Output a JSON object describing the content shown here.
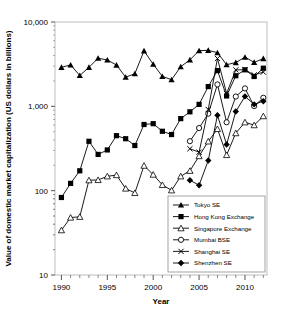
{
  "chart_data": {
    "type": "line",
    "title": "",
    "xlabel": "Year",
    "ylabel": "Value of domestic market capitalization (US dollars in billions)",
    "yscale": "log",
    "ylim": [
      10,
      10000
    ],
    "xlim": [
      1989.3,
      2012.4
    ],
    "ytick_labels": [
      "10",
      "100",
      "1,000",
      "10,000"
    ],
    "ytick_values": [
      10,
      100,
      1000,
      10000
    ],
    "xtick_labels": [
      "1990",
      "1995",
      "2000",
      "2005",
      "2010"
    ],
    "xtick_values": [
      1990,
      1995,
      2000,
      2005,
      2010
    ],
    "grid": false,
    "legend_position": "lower-right",
    "x": [
      1990,
      1991,
      1992,
      1993,
      1994,
      1995,
      1996,
      1997,
      1998,
      1999,
      2000,
      2001,
      2002,
      2003,
      2004,
      2005,
      2006,
      2007,
      2008,
      2009,
      2010,
      2011,
      2012
    ],
    "series": [
      {
        "name": "Tokyo SE",
        "marker": "filled-triangle",
        "values": [
          2900,
          3100,
          2320,
          2900,
          3720,
          3545,
          3088,
          2216,
          2440,
          4546,
          3157,
          2265,
          2069,
          2953,
          3558,
          4573,
          4614,
          4331,
          3116,
          3306,
          3828,
          3325,
          3681
        ]
      },
      {
        "name": "Hong Kong Exchange",
        "marker": "filled-square",
        "values": [
          83,
          122,
          172,
          385,
          269,
          304,
          449,
          413,
          343,
          609,
          623,
          506,
          463,
          715,
          861,
          1055,
          1715,
          2654,
          1328,
          2305,
          2711,
          2258,
          2832
        ]
      },
      {
        "name": "Singapore Exchange",
        "marker": "open-triangle",
        "values": [
          34,
          48,
          49,
          133,
          134,
          148,
          153,
          106,
          94,
          198,
          155,
          117,
          101,
          148,
          172,
          257,
          384,
          539,
          265,
          481,
          647,
          598,
          765
        ]
      },
      {
        "name": "Mumbai BSE",
        "marker": "open-circle",
        "values": [
          null,
          null,
          null,
          null,
          null,
          null,
          null,
          null,
          null,
          null,
          null,
          null,
          null,
          null,
          386,
          553,
          818,
          1819,
          647,
          1307,
          1632,
          1007,
          1263
        ]
      },
      {
        "name": "Shanghai SE",
        "marker": "x-cross",
        "values": [
          null,
          null,
          null,
          null,
          null,
          null,
          null,
          null,
          null,
          null,
          null,
          null,
          null,
          null,
          314,
          286,
          918,
          3694,
          1425,
          2705,
          2716,
          2357,
          2547
        ]
      },
      {
        "name": "Shenzhen SE",
        "marker": "filled-diamond",
        "values": [
          null,
          null,
          null,
          null,
          null,
          null,
          null,
          null,
          null,
          null,
          null,
          null,
          null,
          null,
          133,
          116,
          228,
          784,
          353,
          868,
          1311,
          1055,
          1150
        ]
      }
    ]
  }
}
